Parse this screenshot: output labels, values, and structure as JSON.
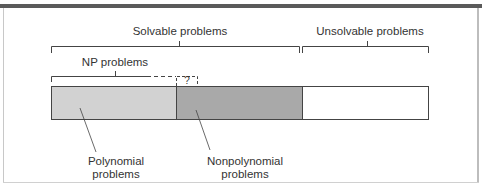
{
  "figure": {
    "labels": {
      "solvable": "Solvable problems",
      "unsolvable": "Unsolvable problems",
      "np": "NP problems",
      "unknown": "?",
      "polynomial_line1": "Polynomial",
      "polynomial_line2": "problems",
      "nonpolynomial_line1": "Nonpolynomial",
      "nonpolynomial_line2": "problems"
    },
    "regions": [
      {
        "name": "Polynomial problems",
        "color": "#d2d2d2"
      },
      {
        "name": "Nonpolynomial problems",
        "color": "#a9a9a9"
      },
      {
        "name": "Unsolvable problems",
        "color": "#ffffff"
      }
    ],
    "colors": {
      "stroke": "#444444",
      "topbar": "#5a5a5a"
    }
  }
}
